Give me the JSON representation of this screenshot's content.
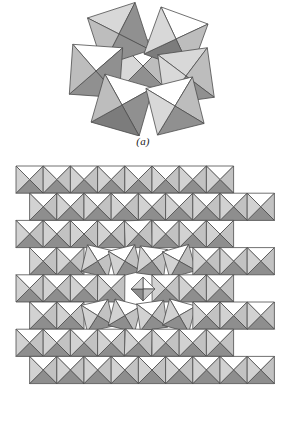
{
  "figure": {
    "panels": [
      {
        "id": "a",
        "caption": "(a)",
        "kind": "polyhedral-cluster",
        "description": "Cluster of corner-sharing octahedra drawn in projection"
      },
      {
        "id": "b",
        "caption": "(b)",
        "kind": "polyhedral-lattice",
        "description": "Checkerboard lattice of corner-sharing octahedra with a central rotated defect"
      }
    ]
  },
  "style": {
    "background": "#ffffff",
    "stroke": "#4d4d4d",
    "stroke_width": 0.8,
    "face_top": "#ffffff",
    "face_left": "#d2d2d2",
    "face_right": "#c2c2c2",
    "face_bottom": "#8e8e8e",
    "face_light": "#d8d8d8",
    "face_mid": "#bdbdbd",
    "face_dark": "#909090",
    "face_darker": "#7c7c7c"
  },
  "chart_data": {
    "type": "diagram",
    "title": "",
    "panel_a": {
      "label": "(a)",
      "center": [
        143,
        68
      ],
      "octahedra": [
        {
          "cx": 143,
          "cy": 68,
          "r": 26,
          "rot": 0
        },
        {
          "cx": 119,
          "cy": 36,
          "r": 25,
          "rot": -18
        },
        {
          "cx": 176,
          "cy": 41,
          "r": 25,
          "rot": 20
        },
        {
          "cx": 96,
          "cy": 73,
          "r": 25,
          "rot": 4
        },
        {
          "cx": 186,
          "cy": 78,
          "r": 25,
          "rot": -8
        },
        {
          "cx": 122,
          "cy": 107,
          "r": 25,
          "rot": 16
        },
        {
          "cx": 175,
          "cy": 108,
          "r": 24,
          "rot": -14
        }
      ]
    },
    "panel_b": {
      "label": "(b)",
      "grid": {
        "cell": 27.2,
        "cols": 9,
        "rows": 8,
        "origin": [
          16,
          166
        ],
        "row_offset": 13.6
      },
      "defect": {
        "center": [
          143,
          289
        ],
        "rotated_units": 8,
        "cavity": "square-plus-four-lobes"
      }
    },
    "legend": [],
    "xlabel": "",
    "ylabel": ""
  }
}
